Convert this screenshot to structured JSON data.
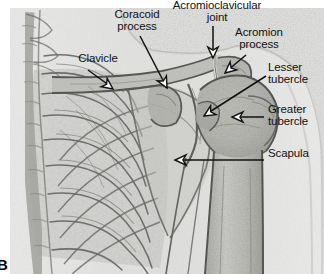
{
  "figure": {
    "panel_letter": "B",
    "modality": "radiograph",
    "region": "shoulder",
    "view": "anteroposterior",
    "background_color": "#ffffff",
    "film_tone": "#d8d8d6",
    "bone_tone": "#b9b9b5",
    "line_color": "#111111"
  },
  "annotations": [
    {
      "id": "coracoid-process",
      "label_line1": "Coracoid",
      "label_line2": "process",
      "label_x": 106,
      "label_y": 8,
      "label_width": 62,
      "align": "center",
      "leader": {
        "x1": 140,
        "y1": 36,
        "x2": 167,
        "y2": 88
      },
      "arrow": {
        "x": 167,
        "y": 88,
        "angle": 62
      }
    },
    {
      "id": "acromioclavicular-joint",
      "label_line1": "Acromioclavicular",
      "label_line2": "joint",
      "label_x": 166,
      "label_y": -1,
      "label_width": 102,
      "align": "center",
      "leader": {
        "x1": 213,
        "y1": 26,
        "x2": 213,
        "y2": 52
      },
      "arrow": {
        "x": 213,
        "y": 58,
        "angle": 90
      }
    },
    {
      "id": "acromion-process",
      "label_line1": "Acromion",
      "label_line2": "process",
      "label_x": 230,
      "label_y": 26,
      "label_width": 58,
      "align": "center",
      "leader": {
        "x1": 246,
        "y1": 55,
        "x2": 228,
        "y2": 70
      },
      "arrow": {
        "x": 225,
        "y": 73,
        "angle": 140
      }
    },
    {
      "id": "lesser-tubercle",
      "label_line1": "Lesser",
      "label_line2": "tubercle",
      "label_x": 268,
      "label_y": 61,
      "label_width": 52,
      "align": "left",
      "leader": {
        "x1": 266,
        "y1": 76,
        "x2": 208,
        "y2": 113
      },
      "arrow": {
        "x": 204,
        "y": 116,
        "angle": 148
      }
    },
    {
      "id": "greater-tubercle",
      "label_line1": "Greater",
      "label_line2": "tubercle",
      "label_x": 268,
      "label_y": 103,
      "label_width": 52,
      "align": "left",
      "leader": {
        "x1": 264,
        "y1": 117,
        "x2": 238,
        "y2": 117
      },
      "arrow": {
        "x": 232,
        "y": 117,
        "angle": 180
      }
    },
    {
      "id": "clavicle",
      "label_line1": "Clavicle",
      "label_line2": "",
      "label_x": 72,
      "label_y": 52,
      "label_width": 52,
      "align": "center",
      "leader": {
        "x1": 88,
        "y1": 70,
        "x2": 110,
        "y2": 86
      },
      "arrow": {
        "x": 113,
        "y": 89,
        "angle": 36
      }
    },
    {
      "id": "scapula",
      "label_line1": "Scapula",
      "label_line2": "",
      "label_x": 268,
      "label_y": 147,
      "label_width": 54,
      "align": "left",
      "leader": {
        "x1": 264,
        "y1": 160,
        "x2": 181,
        "y2": 160
      },
      "arrow": {
        "x": 175,
        "y": 160,
        "angle": 180
      }
    }
  ]
}
